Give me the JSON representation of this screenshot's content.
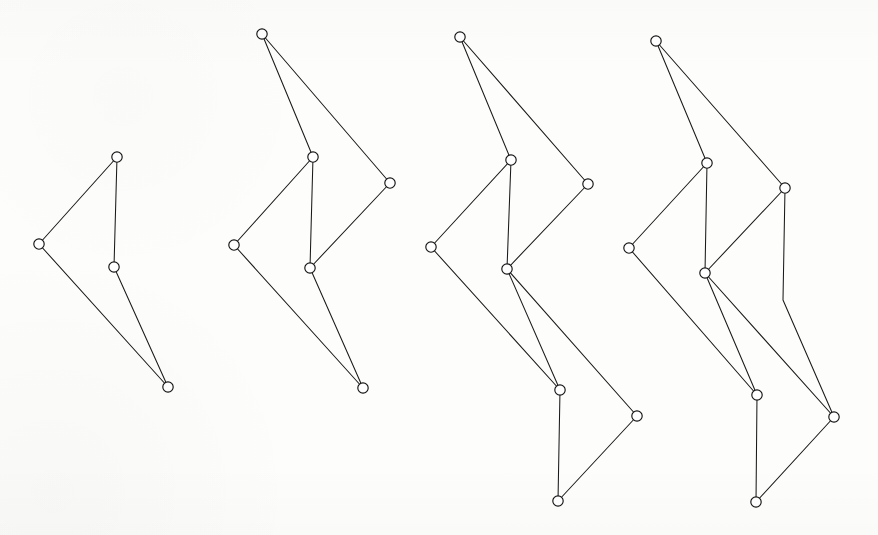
{
  "figure": {
    "background_color": "#fdfdfc",
    "edge_color": "#1a1a1a",
    "node_fill_color": "#ffffff",
    "node_stroke_color": "#141414",
    "node_radius": 5.2,
    "edge_width": 1.05,
    "width": 878,
    "height": 535,
    "graph_count": 4
  },
  "chart_data": {
    "type": "diagram",
    "xlabel": "",
    "ylabel": "",
    "grid": false,
    "legend": "none",
    "coordinate_space": "pixels, origin top-left, 878x535",
    "graphs": [
      {
        "name": "graph-1",
        "node_count": 4,
        "edge_count": 4,
        "nodes": [
          {
            "id": "g1n1",
            "label": "top",
            "x": 117,
            "y": 157
          },
          {
            "id": "g1n2",
            "label": "left",
            "x": 39,
            "y": 244
          },
          {
            "id": "g1n3",
            "label": "middle",
            "x": 114,
            "y": 267
          },
          {
            "id": "g1n4",
            "label": "bottom",
            "x": 168,
            "y": 387
          }
        ],
        "edges": [
          {
            "from": "g1n1",
            "to": "g1n2",
            "points": [
              [
                117,
                157
              ],
              [
                39,
                244
              ]
            ]
          },
          {
            "from": "g1n1",
            "to": "g1n3",
            "points": [
              [
                117,
                157
              ],
              [
                114,
                267
              ]
            ]
          },
          {
            "from": "g1n2",
            "to": "g1n4",
            "points": [
              [
                39,
                244
              ],
              [
                168,
                387
              ]
            ]
          },
          {
            "from": "g1n3",
            "to": "g1n4",
            "points": [
              [
                114,
                267
              ],
              [
                168,
                387
              ]
            ]
          }
        ]
      },
      {
        "name": "graph-2",
        "node_count": 6,
        "edge_count": 7,
        "nodes": [
          {
            "id": "g2n1",
            "label": "top",
            "x": 262,
            "y": 34
          },
          {
            "id": "g2n2",
            "label": "upper-mid",
            "x": 313,
            "y": 157
          },
          {
            "id": "g2n3",
            "label": "right",
            "x": 390,
            "y": 183
          },
          {
            "id": "g2n4",
            "label": "left",
            "x": 234,
            "y": 245
          },
          {
            "id": "g2n5",
            "label": "center",
            "x": 310,
            "y": 268
          },
          {
            "id": "g2n6",
            "label": "bottom",
            "x": 363,
            "y": 388
          }
        ],
        "edges": [
          {
            "from": "g2n1",
            "to": "g2n2",
            "points": [
              [
                262,
                34
              ],
              [
                313,
                157
              ]
            ]
          },
          {
            "from": "g2n1",
            "to": "g2n3",
            "points": [
              [
                262,
                34
              ],
              [
                390,
                183
              ]
            ]
          },
          {
            "from": "g2n2",
            "to": "g2n4",
            "points": [
              [
                313,
                157
              ],
              [
                234,
                245
              ]
            ]
          },
          {
            "from": "g2n2",
            "to": "g2n5",
            "points": [
              [
                313,
                157
              ],
              [
                310,
                268
              ]
            ]
          },
          {
            "from": "g2n3",
            "to": "g2n5",
            "points": [
              [
                390,
                183
              ],
              [
                310,
                268
              ]
            ]
          },
          {
            "from": "g2n4",
            "to": "g2n6",
            "points": [
              [
                234,
                245
              ],
              [
                363,
                388
              ]
            ]
          },
          {
            "from": "g2n5",
            "to": "g2n6",
            "points": [
              [
                310,
                268
              ],
              [
                363,
                388
              ]
            ]
          }
        ]
      },
      {
        "name": "graph-3",
        "node_count": 8,
        "edge_count": 10,
        "nodes": [
          {
            "id": "g3n1",
            "label": "top",
            "x": 460,
            "y": 37
          },
          {
            "id": "g3n2",
            "label": "upper-mid",
            "x": 511,
            "y": 160
          },
          {
            "id": "g3n3",
            "label": "right",
            "x": 588,
            "y": 184
          },
          {
            "id": "g3n4",
            "label": "left",
            "x": 431,
            "y": 247
          },
          {
            "id": "g3n5",
            "label": "center",
            "x": 507,
            "y": 269
          },
          {
            "id": "g3n6",
            "label": "mid-low",
            "x": 560,
            "y": 390
          },
          {
            "id": "g3n7",
            "label": "right-low",
            "x": 637,
            "y": 416
          },
          {
            "id": "g3n8",
            "label": "bottom",
            "x": 558,
            "y": 501
          }
        ],
        "edges": [
          {
            "from": "g3n1",
            "to": "g3n2",
            "points": [
              [
                460,
                37
              ],
              [
                511,
                160
              ]
            ]
          },
          {
            "from": "g3n1",
            "to": "g3n3",
            "points": [
              [
                460,
                37
              ],
              [
                588,
                184
              ]
            ]
          },
          {
            "from": "g3n2",
            "to": "g3n4",
            "points": [
              [
                511,
                160
              ],
              [
                431,
                247
              ]
            ]
          },
          {
            "from": "g3n2",
            "to": "g3n5",
            "points": [
              [
                511,
                160
              ],
              [
                507,
                269
              ]
            ]
          },
          {
            "from": "g3n3",
            "to": "g3n5",
            "points": [
              [
                588,
                184
              ],
              [
                507,
                269
              ]
            ]
          },
          {
            "from": "g3n4",
            "to": "g3n6",
            "points": [
              [
                431,
                247
              ],
              [
                560,
                390
              ]
            ]
          },
          {
            "from": "g3n5",
            "to": "g3n6",
            "points": [
              [
                507,
                269
              ],
              [
                560,
                390
              ]
            ]
          },
          {
            "from": "g3n5",
            "to": "g3n7",
            "points": [
              [
                507,
                269
              ],
              [
                637,
                416
              ]
            ]
          },
          {
            "from": "g3n6",
            "to": "g3n8",
            "points": [
              [
                560,
                390
              ],
              [
                558,
                501
              ]
            ]
          },
          {
            "from": "g3n7",
            "to": "g3n8",
            "points": [
              [
                637,
                416
              ],
              [
                558,
                501
              ]
            ]
          }
        ]
      },
      {
        "name": "graph-4",
        "node_count": 8,
        "edge_count": 11,
        "nodes": [
          {
            "id": "g4n1",
            "label": "top",
            "x": 656,
            "y": 41
          },
          {
            "id": "g4n2",
            "label": "upper-mid",
            "x": 707,
            "y": 163
          },
          {
            "id": "g4n3",
            "label": "right-up",
            "x": 785,
            "y": 188
          },
          {
            "id": "g4n4",
            "label": "left",
            "x": 629,
            "y": 248
          },
          {
            "id": "g4n5",
            "label": "center",
            "x": 705,
            "y": 273
          },
          {
            "id": "g4n6",
            "label": "mid-low",
            "x": 757,
            "y": 395
          },
          {
            "id": "g4n7",
            "label": "right-low",
            "x": 834,
            "y": 417
          },
          {
            "id": "g4n8",
            "label": "bottom",
            "x": 756,
            "y": 502
          }
        ],
        "edges": [
          {
            "from": "g4n1",
            "to": "g4n2",
            "points": [
              [
                656,
                41
              ],
              [
                707,
                163
              ]
            ]
          },
          {
            "from": "g4n1",
            "to": "g4n3",
            "points": [
              [
                656,
                41
              ],
              [
                785,
                188
              ]
            ]
          },
          {
            "from": "g4n2",
            "to": "g4n4",
            "points": [
              [
                707,
                163
              ],
              [
                629,
                248
              ]
            ]
          },
          {
            "from": "g4n2",
            "to": "g4n5",
            "points": [
              [
                707,
                163
              ],
              [
                705,
                273
              ]
            ]
          },
          {
            "from": "g4n3",
            "to": "g4n5",
            "points": [
              [
                785,
                188
              ],
              [
                705,
                273
              ]
            ]
          },
          {
            "from": "g4n3",
            "to": "g4n7",
            "points": [
              [
                785,
                188
              ],
              [
                783,
                300
              ],
              [
                834,
                417
              ]
            ]
          },
          {
            "from": "g4n4",
            "to": "g4n6",
            "points": [
              [
                629,
                248
              ],
              [
                757,
                395
              ]
            ]
          },
          {
            "from": "g4n5",
            "to": "g4n6",
            "points": [
              [
                705,
                273
              ],
              [
                757,
                395
              ]
            ]
          },
          {
            "from": "g4n5",
            "to": "g4n7",
            "points": [
              [
                705,
                273
              ],
              [
                834,
                417
              ]
            ]
          },
          {
            "from": "g4n6",
            "to": "g4n8",
            "points": [
              [
                757,
                395
              ],
              [
                756,
                502
              ]
            ]
          },
          {
            "from": "g4n7",
            "to": "g4n8",
            "points": [
              [
                834,
                417
              ],
              [
                756,
                502
              ]
            ]
          }
        ]
      }
    ]
  }
}
